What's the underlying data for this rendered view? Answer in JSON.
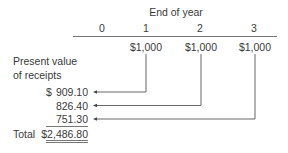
{
  "header": {
    "title": "End of year"
  },
  "timeline": {
    "years": [
      "0",
      "1",
      "2",
      "3"
    ],
    "cashflows": [
      {
        "year": "1",
        "amount": "$1,000"
      },
      {
        "year": "2",
        "amount": "$1,000"
      },
      {
        "year": "3",
        "amount": "$1,000"
      }
    ]
  },
  "left_label": {
    "line1": "Present value",
    "line2": "of receipts"
  },
  "present_values": [
    {
      "currency": "$",
      "value": "909.10"
    },
    {
      "currency": "",
      "value": "826.40"
    },
    {
      "currency": "",
      "value": "751.30"
    }
  ],
  "total": {
    "label": "Total",
    "value": "$2,486.80"
  },
  "colors": {
    "ink": "#3a3a3a",
    "line": "#555555"
  }
}
